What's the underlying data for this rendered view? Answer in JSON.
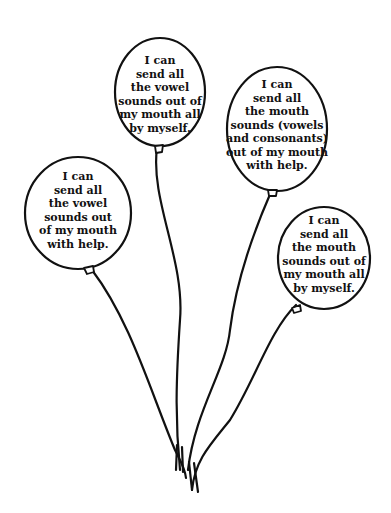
{
  "balloons": [
    {
      "id": "top-center",
      "text": "I can\nsend all\nthe vowel\nsounds out of\nmy mouth all\nby myself."
    },
    {
      "id": "top-right",
      "text": "I can\nsend all\nthe mouth\nsounds (vowels\nand consonants)\nout of my mouth\nwith help."
    },
    {
      "id": "left",
      "text": "I can\nsend all\nthe vowel\nsounds out\nof my mouth\nwith help."
    },
    {
      "id": "bottom-right",
      "text": "I can\nsend all\nthe mouth\nsounds out of\nmy mouth all\nby myself."
    }
  ],
  "colors": {
    "stroke": "#111111",
    "fill": "#ffffff"
  }
}
